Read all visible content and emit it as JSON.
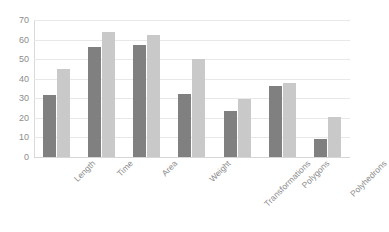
{
  "chart_data": {
    "type": "bar",
    "title": "",
    "subtitle": "",
    "xlabel": "",
    "ylabel": "",
    "ylim": [
      0,
      70
    ],
    "ytick_step": 10,
    "ytick_labels": [
      "0",
      "10",
      "20",
      "30",
      "40",
      "50",
      "60",
      "70"
    ],
    "grid": true,
    "legend": false,
    "legend_position": "none",
    "orientation": "vertical",
    "grouping": "clustered",
    "categories": [
      "Length",
      "Time",
      "Area",
      "Weight",
      "Transformations",
      "Polygons",
      "Polyhedrons"
    ],
    "series": [
      {
        "name": "Series 1",
        "color": "#808080",
        "values": [
          31.5,
          56,
          57,
          32,
          23.5,
          36.5,
          9
        ]
      },
      {
        "name": "Series 2",
        "color": "#c9c9c9",
        "values": [
          45,
          64,
          62.5,
          50,
          29.5,
          38,
          20.5
        ]
      }
    ]
  },
  "style": {
    "background": "#ffffff",
    "gridline_color": "#e8e8e8",
    "axis_color": "#d9d9d9",
    "tick_label_color": "#8c8c8c"
  }
}
